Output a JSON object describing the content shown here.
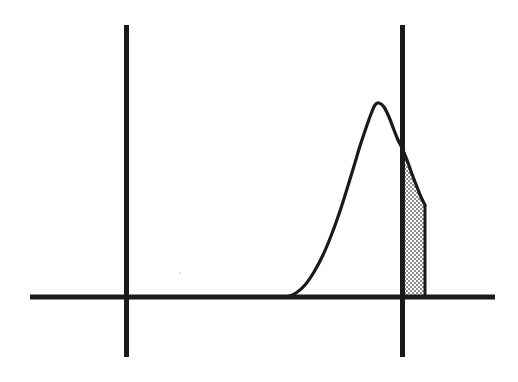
{
  "figure": {
    "title": "",
    "background_color": "#ffffff",
    "width": 518,
    "height": 382,
    "ink_color": "#1a1a1a",
    "shade_color": "#b0b0b0",
    "caption": ""
  },
  "chart_data": {
    "type": "area",
    "title": "",
    "subtitle": "",
    "xlabel": "",
    "ylabel": "",
    "grid": false,
    "legend": null,
    "annotations": [],
    "axis_baseline": {
      "name": "horizontal-axis",
      "y": 297,
      "x_start": 30,
      "x_end": 495,
      "thickness": 5
    },
    "vertical_lines": [
      {
        "name": "left-vertical-line",
        "x": 126,
        "y_top": 25,
        "y_bottom": 357,
        "thickness": 5
      },
      {
        "name": "right-vertical-line",
        "x": 402,
        "y_top": 25,
        "y_bottom": 357,
        "thickness": 5
      }
    ],
    "curve": {
      "name": "distribution-curve",
      "stroke_width": 3,
      "onset_x": 287,
      "peak_x": 375,
      "peak_y": 103,
      "crossing_x": 402,
      "crossing_y": 148,
      "tail_cut_x": 425,
      "tail_cut_y": 205,
      "points": [
        [
          287,
          297
        ],
        [
          296,
          293
        ],
        [
          305,
          285
        ],
        [
          314,
          272
        ],
        [
          323,
          255
        ],
        [
          331,
          236
        ],
        [
          339,
          214
        ],
        [
          347,
          189
        ],
        [
          354,
          166
        ],
        [
          360,
          146
        ],
        [
          366,
          128
        ],
        [
          371,
          114
        ],
        [
          375,
          105
        ],
        [
          379,
          103
        ],
        [
          384,
          107
        ],
        [
          389,
          117
        ],
        [
          394,
          130
        ],
        [
          398,
          140
        ],
        [
          402,
          148
        ],
        [
          407,
          160
        ],
        [
          412,
          174
        ],
        [
          417,
          187
        ],
        [
          421,
          197
        ],
        [
          425,
          205
        ]
      ]
    },
    "shaded_region": {
      "name": "tail-area",
      "fill": "checkerboard-gray",
      "fill_color": "#b0b0b0",
      "x_left": 402,
      "x_right": 425,
      "y_baseline": 297,
      "y_top_left": 148,
      "y_top_right": 205,
      "outline": true
    }
  }
}
